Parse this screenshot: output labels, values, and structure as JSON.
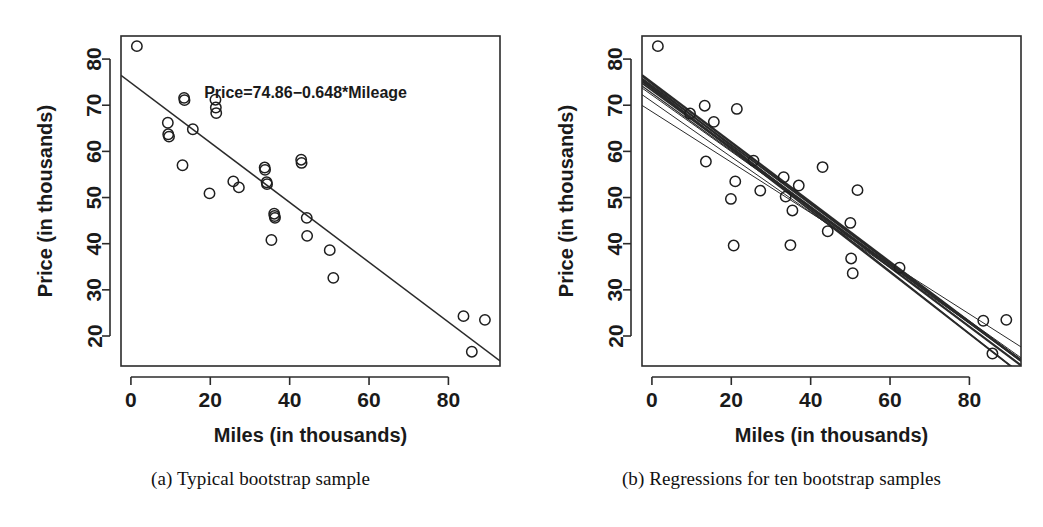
{
  "figure": {
    "panels": [
      {
        "id": "a",
        "caption": "(a) Typical bootstrap sample",
        "annotation": "Price=74.86−0.648*Mileage"
      },
      {
        "id": "b",
        "caption": "(b) Regressions for ten bootstrap samples",
        "annotation": ""
      }
    ]
  },
  "chart_data": [
    {
      "type": "scatter",
      "title": "",
      "panel": "a",
      "xlabel": "Miles (in thousands)",
      "ylabel": "Price (in thousands)",
      "xlim": [
        -2.5,
        93
      ],
      "ylim": [
        13.5,
        85
      ],
      "xticks": [
        0,
        20,
        40,
        60,
        80
      ],
      "yticks": [
        20,
        30,
        40,
        50,
        60,
        70,
        80
      ],
      "grid": false,
      "legend": "none",
      "annotations": [
        {
          "text": "Price=74.86−0.648*Mileage",
          "x": 44,
          "y": 71.5
        }
      ],
      "points": [
        {
          "x": 1.5,
          "y": 82.8
        },
        {
          "x": 9.3,
          "y": 66.2
        },
        {
          "x": 9.4,
          "y": 63.7
        },
        {
          "x": 9.6,
          "y": 63.2
        },
        {
          "x": 13.0,
          "y": 57.0
        },
        {
          "x": 13.4,
          "y": 71.6
        },
        {
          "x": 13.5,
          "y": 71.1
        },
        {
          "x": 15.6,
          "y": 64.8
        },
        {
          "x": 19.8,
          "y": 50.9
        },
        {
          "x": 21.3,
          "y": 71.2
        },
        {
          "x": 21.4,
          "y": 69.5
        },
        {
          "x": 21.5,
          "y": 68.3
        },
        {
          "x": 25.8,
          "y": 53.5
        },
        {
          "x": 27.2,
          "y": 52.2
        },
        {
          "x": 33.7,
          "y": 56.5
        },
        {
          "x": 33.8,
          "y": 56.0
        },
        {
          "x": 34.2,
          "y": 53.3
        },
        {
          "x": 34.3,
          "y": 52.9
        },
        {
          "x": 35.4,
          "y": 40.8
        },
        {
          "x": 36.1,
          "y": 46.5
        },
        {
          "x": 36.2,
          "y": 46.0
        },
        {
          "x": 36.3,
          "y": 45.6
        },
        {
          "x": 42.9,
          "y": 58.2
        },
        {
          "x": 43.0,
          "y": 57.5
        },
        {
          "x": 44.3,
          "y": 45.6
        },
        {
          "x": 44.4,
          "y": 41.7
        },
        {
          "x": 50.1,
          "y": 38.6
        },
        {
          "x": 51.0,
          "y": 32.6
        },
        {
          "x": 83.8,
          "y": 24.3
        },
        {
          "x": 85.9,
          "y": 16.6
        },
        {
          "x": 89.2,
          "y": 23.5
        }
      ],
      "fit_line": {
        "intercept": 74.86,
        "slope": -0.648,
        "x_start": -2.5,
        "x_end": 93
      }
    },
    {
      "type": "scatter",
      "title": "",
      "panel": "b",
      "xlabel": "Miles (in thousands)",
      "ylabel": "Price (in thousands)",
      "xlim": [
        -2.5,
        93
      ],
      "ylim": [
        13.5,
        85
      ],
      "xticks": [
        0,
        20,
        40,
        60,
        80
      ],
      "yticks": [
        20,
        30,
        40,
        50,
        60,
        70,
        80
      ],
      "grid": false,
      "legend": "none",
      "annotations": [],
      "points": [
        {
          "x": 1.5,
          "y": 82.8
        },
        {
          "x": 9.6,
          "y": 68.2
        },
        {
          "x": 13.3,
          "y": 69.9
        },
        {
          "x": 13.6,
          "y": 57.8
        },
        {
          "x": 15.6,
          "y": 66.4
        },
        {
          "x": 19.9,
          "y": 49.7
        },
        {
          "x": 20.6,
          "y": 39.6
        },
        {
          "x": 21.0,
          "y": 53.5
        },
        {
          "x": 21.4,
          "y": 69.2
        },
        {
          "x": 25.6,
          "y": 58.0
        },
        {
          "x": 27.3,
          "y": 51.5
        },
        {
          "x": 33.2,
          "y": 54.4
        },
        {
          "x": 33.7,
          "y": 50.2
        },
        {
          "x": 34.9,
          "y": 39.7
        },
        {
          "x": 35.4,
          "y": 47.2
        },
        {
          "x": 37.0,
          "y": 52.6
        },
        {
          "x": 43.0,
          "y": 56.6
        },
        {
          "x": 44.3,
          "y": 42.7
        },
        {
          "x": 50.0,
          "y": 44.5
        },
        {
          "x": 50.2,
          "y": 36.8
        },
        {
          "x": 50.6,
          "y": 33.6
        },
        {
          "x": 51.8,
          "y": 51.6
        },
        {
          "x": 62.4,
          "y": 34.8
        },
        {
          "x": 83.5,
          "y": 23.3
        },
        {
          "x": 85.8,
          "y": 16.2
        },
        {
          "x": 89.3,
          "y": 23.5
        }
      ],
      "regression_lines": [
        {
          "intercept": 74.9,
          "slope": -0.648,
          "width": 2.4
        },
        {
          "intercept": 74.2,
          "slope": -0.64,
          "width": 2.0
        },
        {
          "intercept": 73.6,
          "slope": -0.645,
          "width": 2.2
        },
        {
          "intercept": 73.2,
          "slope": -0.63,
          "width": 1.6
        },
        {
          "intercept": 72.6,
          "slope": -0.622,
          "width": 1.2
        },
        {
          "intercept": 74.6,
          "slope": -0.676,
          "width": 1.4
        },
        {
          "intercept": 73.9,
          "slope": -0.668,
          "width": 1.8
        },
        {
          "intercept": 72.2,
          "slope": -0.612,
          "width": 1.0
        },
        {
          "intercept": 70.8,
          "slope": -0.6,
          "width": 1.0
        },
        {
          "intercept": 68.6,
          "slope": -0.548,
          "width": 1.0
        }
      ]
    }
  ]
}
